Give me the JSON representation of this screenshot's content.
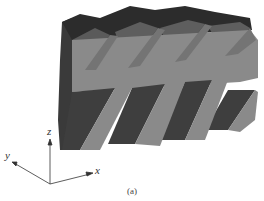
{
  "figure": {
    "caption": "(a)",
    "axes": {
      "x_label": "x",
      "y_label": "y",
      "z_label": "z"
    },
    "colors": {
      "light_face": "#8c8c8c",
      "mid_face": "#6e6e6e",
      "dark_face": "#3c3c3c",
      "darkest_face": "#2a2a2a",
      "axis": "#333333",
      "background": "#ffffff"
    }
  }
}
